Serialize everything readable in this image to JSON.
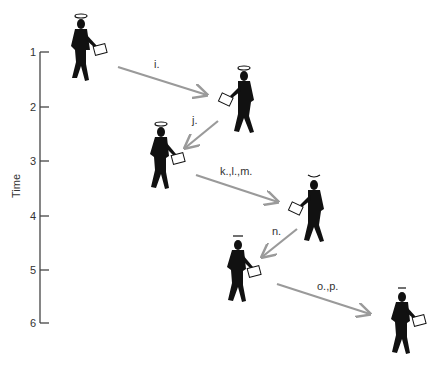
{
  "axis": {
    "title": "Time",
    "ticks": [
      "1",
      "2",
      "3",
      "4",
      "5",
      "6"
    ]
  },
  "figures": [
    {
      "id": "t1",
      "halo": "full-halo",
      "facing": "right"
    },
    {
      "id": "t2",
      "halo": "full-halo",
      "facing": "left"
    },
    {
      "id": "t3",
      "halo": "full-halo",
      "facing": "right"
    },
    {
      "id": "t4",
      "halo": "partial-halo",
      "facing": "left"
    },
    {
      "id": "t5",
      "halo": "partial-halo",
      "facing": "right"
    },
    {
      "id": "t6",
      "halo": "small-halo",
      "facing": "right"
    }
  ],
  "arrows": [
    {
      "label": "i."
    },
    {
      "label": "j."
    },
    {
      "label": "k.,l.,m."
    },
    {
      "label": "n."
    },
    {
      "label": "o.,p."
    }
  ],
  "colors": {
    "arrow": "#9a9a9a",
    "axis": "#444444",
    "figure": "#111111"
  }
}
